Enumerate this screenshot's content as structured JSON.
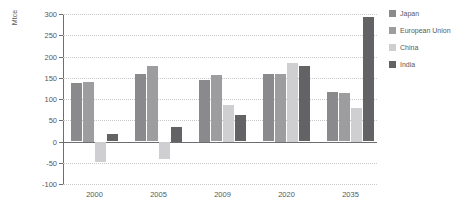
{
  "chart_data": {
    "type": "bar",
    "title": "",
    "xlabel": "",
    "ylabel": "Mtce",
    "categories": [
      "2000",
      "2005",
      "2009",
      "2020",
      "2035"
    ],
    "series": [
      {
        "name": "Japan",
        "color": "#8a8a8c",
        "values": [
          137,
          158,
          145,
          158,
          117
        ]
      },
      {
        "name": "European Union",
        "color": "#9d9d9f",
        "values": [
          140,
          177,
          156,
          160,
          113
        ]
      },
      {
        "name": "China",
        "color": "#cfcfd1",
        "values": [
          -48,
          -42,
          85,
          185,
          80
        ]
      },
      {
        "name": "India",
        "color": "#636365",
        "values": [
          18,
          35,
          63,
          178,
          292
        ]
      }
    ],
    "ylim": [
      -100,
      300
    ],
    "yticks": [
      300,
      250,
      200,
      150,
      100,
      50,
      0,
      -50,
      -100
    ],
    "ytick_labels": [
      "300",
      "250",
      "200",
      "150",
      "100",
      "50",
      "0",
      "-50",
      "-100"
    ],
    "grid": true,
    "legend_position": "right",
    "axis_color": "#6d6e70",
    "grid_color": "#c9c9c9",
    "background": "#ffffff"
  }
}
